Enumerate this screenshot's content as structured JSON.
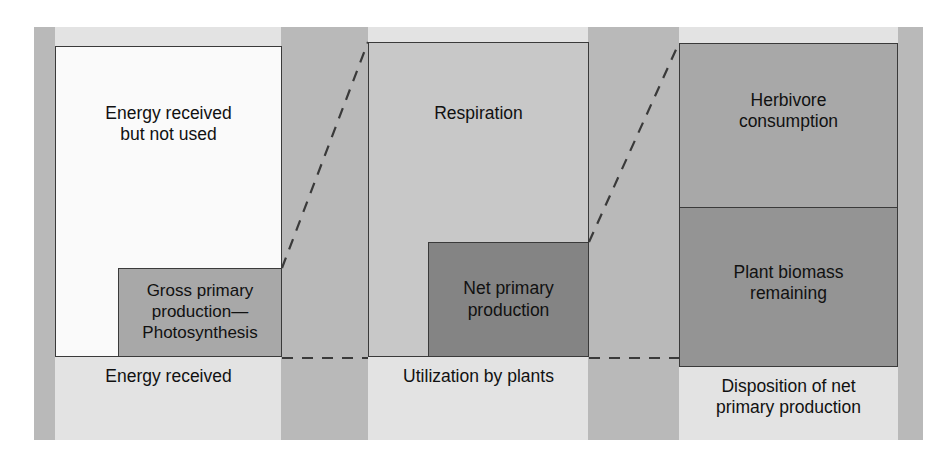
{
  "figure": {
    "kind": "energy-flow-diagram",
    "background_color": "#e3e3e3",
    "band_color": "#b9b9b9",
    "outline_color": "#3a3a3a",
    "text_color": "#111111"
  },
  "panels": [
    {
      "id": "energy-received",
      "caption": "Energy received",
      "boxes": [
        {
          "id": "energy-received-but-not-used",
          "label": "Energy received\nbut not used",
          "fill": "#fafafa"
        },
        {
          "id": "gross-primary-production",
          "label": "Gross primary\nproduction—\nPhotosynthesis",
          "fill": "#a8a8a8"
        }
      ]
    },
    {
      "id": "utilization-by-plants",
      "caption": "Utilization by plants",
      "boxes": [
        {
          "id": "respiration",
          "label": "Respiration",
          "fill": "#c8c8c8"
        },
        {
          "id": "net-primary-production",
          "label": "Net primary\nproduction",
          "fill": "#848484"
        }
      ]
    },
    {
      "id": "disposition-of-net-primary-production",
      "caption": "Disposition of net\nprimary production",
      "boxes": [
        {
          "id": "herbivore-consumption",
          "label": "Herbivore\nconsumption",
          "fill": "#a8a8a8"
        },
        {
          "id": "plant-biomass-remaining",
          "label": "Plant biomass\nremaining",
          "fill": "#949494"
        }
      ]
    }
  ],
  "connectors": [
    {
      "id": "gpp-to-utilization-top",
      "from": "gross-primary-production-top-right",
      "to": "respiration-top-left",
      "style": "dashed"
    },
    {
      "id": "gpp-to-utilization-bottom",
      "from": "gross-primary-production-bottom-right",
      "to": "respiration-bottom-left",
      "style": "dashed"
    },
    {
      "id": "npp-to-disposition-top",
      "from": "net-primary-production-top-right",
      "to": "herbivore-consumption-top-left",
      "style": "dashed"
    },
    {
      "id": "npp-to-disposition-bottom",
      "from": "net-primary-production-bottom-right",
      "to": "plant-biomass-remaining-bottom-left",
      "style": "dashed"
    }
  ]
}
